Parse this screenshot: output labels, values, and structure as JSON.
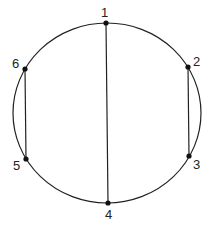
{
  "diagram": {
    "type": "circle-chord-diagram",
    "colors": {
      "stroke": "#222222",
      "point": "#111111",
      "background": "#ffffff"
    },
    "circle": {
      "cx": 107,
      "cy": 113,
      "rx": 94,
      "ry": 90
    },
    "points": [
      {
        "id": "1",
        "label": "1",
        "x": 106,
        "y": 23,
        "lx": 105,
        "ly": 17
      },
      {
        "id": "2",
        "label": "2",
        "x": 188,
        "y": 67,
        "lx": 197,
        "ly": 66
      },
      {
        "id": "3",
        "label": "3",
        "x": 189,
        "y": 156,
        "lx": 197,
        "ly": 169
      },
      {
        "id": "4",
        "label": "4",
        "x": 108,
        "y": 203,
        "lx": 109,
        "ly": 219
      },
      {
        "id": "5",
        "label": "5",
        "x": 26,
        "y": 159,
        "lx": 18,
        "ly": 170
      },
      {
        "id": "6",
        "label": "6",
        "x": 25,
        "y": 69,
        "lx": 17,
        "ly": 68
      }
    ],
    "chords": [
      {
        "from": "1",
        "to": "4"
      },
      {
        "from": "2",
        "to": "3"
      },
      {
        "from": "6",
        "to": "5"
      }
    ]
  }
}
